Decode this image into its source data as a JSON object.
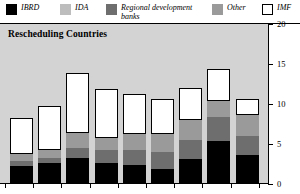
{
  "legend": {
    "items": [
      {
        "label": "IBRD",
        "color": "#000000",
        "swatch_name": "legend-swatch-ibrd",
        "x": 6,
        "width": 46
      },
      {
        "label": "IDA",
        "color": "#bdbdbd",
        "swatch_name": "legend-swatch-ida",
        "x": 60,
        "width": 44
      },
      {
        "label": "Regional development\nbanks",
        "color": "#6e6e6e",
        "swatch_name": "legend-swatch-regional",
        "x": 106,
        "width": 100
      },
      {
        "label": "Other",
        "color": "#9a9a9a",
        "swatch_name": "legend-swatch-other",
        "x": 212,
        "width": 46
      },
      {
        "label": "IMF",
        "color": "#ffffff",
        "swatch_name": "legend-swatch-imf",
        "x": 262,
        "width": 38
      }
    ]
  },
  "chart_data": {
    "type": "bar",
    "subtype": "stacked",
    "title": "Rescheduling Countries",
    "xlabel": "",
    "ylabel": "",
    "ylim": [
      0,
      20
    ],
    "yticks": [
      0,
      5,
      10,
      15,
      20
    ],
    "ytick_labels": [
      "0",
      "5",
      "10",
      "15",
      "20"
    ],
    "grid": false,
    "legend_position": "top",
    "axis_side": "right",
    "plot_background": "#d3d3d3",
    "categories": [
      "1",
      "2",
      "3",
      "4",
      "5",
      "6",
      "7",
      "8",
      "9"
    ],
    "series": [
      {
        "name": "IBRD",
        "color": "#000000",
        "values": [
          2.3,
          2.6,
          3.2,
          2.6,
          2.4,
          1.9,
          3.1,
          5.4,
          3.6
        ]
      },
      {
        "name": "Regional development banks",
        "color": "#6e6e6e",
        "values": [
          0.6,
          0.7,
          1.3,
          1.6,
          1.9,
          2.1,
          2.4,
          3.0,
          2.4
        ]
      },
      {
        "name": "Other",
        "color": "#9a9a9a",
        "values": [
          0.9,
          1.0,
          1.9,
          1.6,
          1.9,
          2.2,
          2.5,
          2.0,
          2.6
        ]
      },
      {
        "name": "IMF",
        "color": "#ffffff",
        "values": [
          4.5,
          5.4,
          7.5,
          6.1,
          5.0,
          4.4,
          4.0,
          4.0,
          2.0
        ]
      }
    ],
    "totals": [
      8.3,
      9.7,
      13.9,
      11.9,
      11.2,
      10.6,
      12.0,
      14.4,
      10.6
    ]
  }
}
